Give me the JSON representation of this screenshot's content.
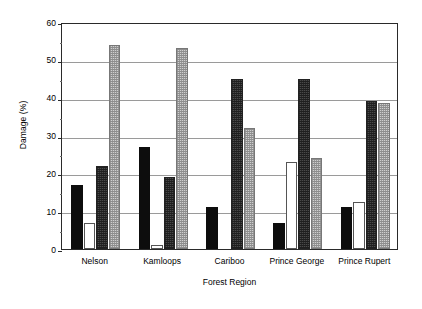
{
  "chart_data": {
    "type": "bar",
    "title": "",
    "xlabel": "Forest Region",
    "ylabel": "Damage (%)",
    "categories": [
      "Nelson",
      "Kamloops",
      "Cariboo",
      "Prince George",
      "Prince Rupert"
    ],
    "series": [
      {
        "name": "series-1-black",
        "values": [
          17,
          27,
          11,
          7,
          11
        ]
      },
      {
        "name": "series-2-open",
        "values": [
          7,
          1,
          0,
          23,
          12.5
        ]
      },
      {
        "name": "series-3-dark-hatch",
        "values": [
          22,
          19,
          45,
          45,
          39
        ]
      },
      {
        "name": "series-4-light-hatch",
        "values": [
          54,
          53,
          32,
          24,
          38.5
        ]
      }
    ],
    "ylim": [
      0,
      60
    ],
    "yticks": [
      0,
      10,
      20,
      30,
      40,
      50,
      60
    ],
    "ytick_labels": [
      "0",
      "10",
      "20",
      "30",
      "40",
      "50",
      "60"
    ],
    "grid": true,
    "legend": "none",
    "colors": {
      "series_1": "#0d0d0d",
      "series_2": "#ffffff",
      "series_3": "#4a4a4a",
      "series_4": "#cfcfcf",
      "axis": "#2a2a2a",
      "gridline": "#9a9a9a",
      "background": "#ffffff"
    }
  }
}
